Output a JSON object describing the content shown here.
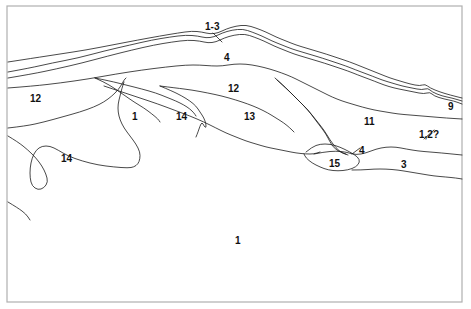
{
  "figure": {
    "kind": "geological-cross-section",
    "background_color": "#ffffff",
    "line_color": "#1a1a1a",
    "frame_color": "#b0b0b0",
    "frame": {
      "x": 7,
      "y": 6,
      "width": 455,
      "height": 296
    },
    "canvas": {
      "width": 471,
      "height": 309
    }
  },
  "labels": [
    {
      "id": "label-1-3",
      "text": "1-3",
      "x": 205,
      "y": 22
    },
    {
      "id": "label-4-top",
      "text": "4",
      "x": 224,
      "y": 53
    },
    {
      "id": "label-12-mid",
      "text": "12",
      "x": 228,
      "y": 84
    },
    {
      "id": "label-12-left",
      "text": "12",
      "x": 30,
      "y": 94
    },
    {
      "id": "label-9",
      "text": "9",
      "x": 448,
      "y": 102
    },
    {
      "id": "label-1-mid",
      "text": "1",
      "x": 132,
      "y": 112
    },
    {
      "id": "label-14-mid",
      "text": "14",
      "x": 176,
      "y": 112
    },
    {
      "id": "label-13",
      "text": "13",
      "x": 244,
      "y": 112
    },
    {
      "id": "label-11",
      "text": "11",
      "x": 364,
      "y": 117
    },
    {
      "id": "label-1-2q",
      "text": "1,2?",
      "x": 419,
      "y": 130
    },
    {
      "id": "label-4-mid",
      "text": "4",
      "x": 359,
      "y": 146
    },
    {
      "id": "label-14-left",
      "text": "14",
      "x": 61,
      "y": 154
    },
    {
      "id": "label-15",
      "text": "15",
      "x": 329,
      "y": 159
    },
    {
      "id": "label-3",
      "text": "3",
      "x": 401,
      "y": 160
    },
    {
      "id": "label-1-bottom",
      "text": "1",
      "x": 235,
      "y": 236
    }
  ],
  "chart_data": {
    "type": "line",
    "title": "",
    "xlabel": "",
    "ylabel": "",
    "units": [
      "1-3",
      "4",
      "12",
      "1",
      "14",
      "13",
      "11",
      "9",
      "1,2?",
      "15",
      "3"
    ],
    "series": [
      {
        "name": "upper-contact-a",
        "points": "8,72 30,68 52,63 78,58 104,51 130,45 152,40 170,37 186,35 198,36 206,38 214,37 222,33 232,30 243,29 252,32 262,36 272,41 282,45 292,49 302,52 312,55 322,58 334,62 346,66 356,70 364,73 372,76 382,80 392,83 402,86 412,88 422,90 428,88 432,92 442,96 452,98 462,101"
      },
      {
        "name": "upper-contact-b",
        "points": "8,78 32,74 56,69 82,63 108,56 132,50 154,45 172,42 188,40 200,41 208,43 216,42 224,38 234,35 245,34 254,37 264,41 274,46 284,50 294,54 304,57 314,60 324,63 336,67 348,71 358,75 366,78 374,81 384,85 394,88 404,90 414,92 424,94 430,92 434,96 444,99 454,101 462,104"
      },
      {
        "name": "mid-contact-c",
        "points": "8,62 34,58 60,54 86,50 112,45 138,40 160,36 178,33 192,31 202,32 210,34 218,33 226,29 236,26 246,25 256,28 266,32 276,37 286,41 296,45 306,48 316,51 326,54 338,58 350,62 360,66 370,70 380,74 390,78 400,81 410,84 420,86 425,84 430,88 440,92 450,95 462,98"
      },
      {
        "name": "nappe-roof",
        "points": "8,88 34,86 60,83 88,79 116,74 142,70 166,67 186,65 200,65 212,66 222,66 234,64 246,64 258,66 270,69 282,73 292,77 300,81 308,85 316,89 324,93 332,97 342,101 352,104 362,107 374,110 386,112 398,114 410,115 422,116 434,117 446,118 462,119"
      },
      {
        "name": "left-fold-upper",
        "points": "8,128 26,126 44,122 62,117 80,112 94,107 104,102 112,96 118,90 122,84 124,80 126,78"
      },
      {
        "name": "wedge-1",
        "points": "95,78 104,82 114,88 124,95 134,102 144,108 152,114 158,119 160,122"
      },
      {
        "name": "wedge-1-right",
        "points": "95,78 110,81 126,85 142,89 156,93 166,97 176,101 184,105 190,109 194,113 196,116"
      },
      {
        "name": "wedge-2",
        "points": "160,86 172,91 182,96 190,101 196,106 200,112 204,118 206,124 206,128 204,126 202,122 200,126 198,132 196,137"
      },
      {
        "name": "wedge-2-top",
        "points": "160,86 176,88 192,90 208,93 222,96 236,100 248,104 258,108 268,113 276,118 284,123 290,128 294,132"
      },
      {
        "name": "nappe-13-base",
        "points": "104,86 122,92 140,98 158,104 174,110 190,116 204,122 216,128 226,133 236,137 246,141 256,144 266,147 276,149 286,151 296,153 306,154 314,154 320,152"
      },
      {
        "name": "thrust-15-top",
        "points": "275,78 284,86 292,94 300,102 308,110 314,118 320,126 326,134 330,142 334,148 340,152 346,154"
      },
      {
        "name": "thrust-15-top2",
        "points": "277,80 288,90 298,100 308,110 316,120 324,130 330,140 336,148 342,153 348,155"
      },
      {
        "name": "lens-15-outline",
        "points": "306,152 312,147 320,144 330,144 340,147 350,152 358,157 360,162 356,167 348,170 338,171 328,170 320,167 312,163 306,158 304,154"
      },
      {
        "name": "lower-right-contact",
        "points": "314,154 324,152 336,151 346,152 356,155 366,153 376,149 386,147 396,147 406,149 418,151 430,152 442,153 452,154 462,155"
      },
      {
        "name": "lower-right-contact2",
        "points": "352,170 362,170 374,169 386,169 398,170 410,172 422,174 434,176 446,177 456,178 462,179"
      },
      {
        "name": "left-hook",
        "points": "8,136 18,142 28,150 36,158 42,166 46,174 48,182 44,188 38,190 32,186 30,178 30,168 32,158 36,150 42,146 50,146 58,150 68,156 82,161 98,165 114,167 128,168 134,167 138,164 140,159 140,152 136,144 130,136 124,128 120,120 118,112 118,104 120,96 122,88 124,82"
      },
      {
        "name": "bottom-left-tail",
        "points": "8,202 18,208 26,214 30,220"
      }
    ]
  }
}
